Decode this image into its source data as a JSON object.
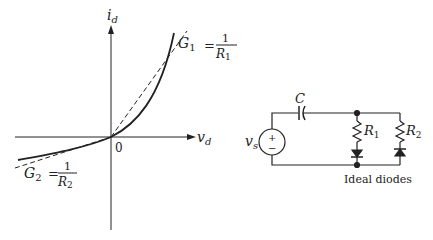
{
  "graph": {
    "y_axis_label": "i",
    "y_axis_sub": "d",
    "x_axis_label": "v",
    "x_axis_sub": "d",
    "origin_label": "0",
    "g1": {
      "name": "G",
      "sub": "1",
      "eq": "=",
      "num": "1",
      "den": "R",
      "den_sub": "1"
    },
    "g2": {
      "name": "G",
      "sub": "2",
      "eq": "=",
      "num": "1",
      "den": "R",
      "den_sub": "2"
    }
  },
  "circuit": {
    "capacitor_label": "C",
    "source_label": "v",
    "source_sub": "s",
    "source_plus": "+",
    "source_minus": "−",
    "r1_label": "R",
    "r1_sub": "1",
    "r2_label": "R",
    "r2_sub": "2",
    "caption": "Ideal diodes"
  }
}
